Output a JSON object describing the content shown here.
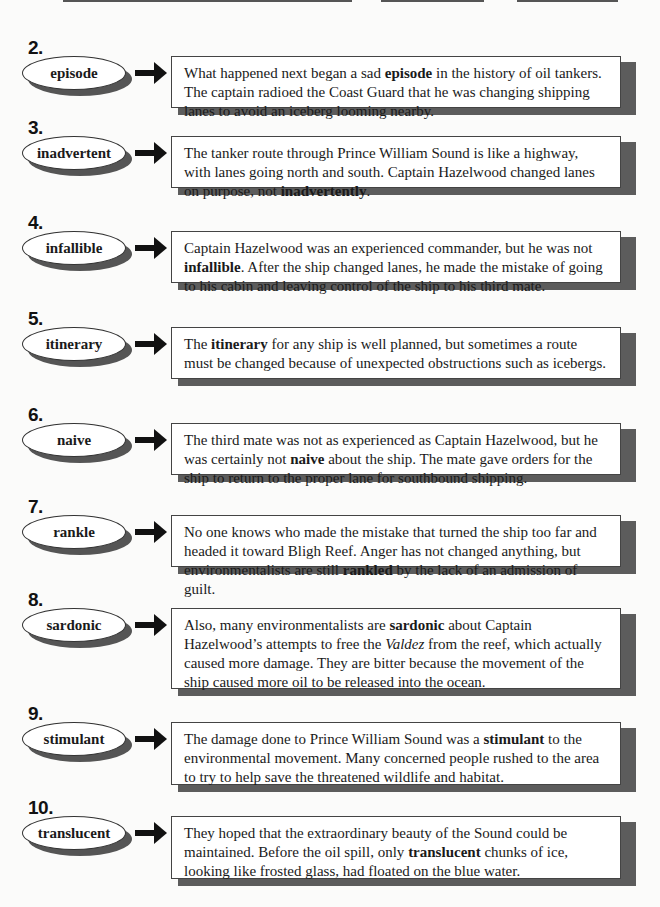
{
  "header_blanks": [
    {
      "name": "name-blank",
      "left": 63,
      "width": 289
    },
    {
      "name": "date-blank",
      "left": 381,
      "width": 103
    },
    {
      "name": "class-blank",
      "left": 517,
      "width": 101
    }
  ],
  "items": [
    {
      "number": "2.",
      "word": "episode",
      "top": 37,
      "box_height": 52,
      "text_before": "What happened next began a sad ",
      "bold": "episode",
      "text_after": " in the history of oil tankers. The captain radioed the Coast Guard that he was changing shipping lanes to avoid an iceberg looming nearby."
    },
    {
      "number": "3.",
      "word": "inadvertent",
      "top": 117,
      "box_height": 52,
      "text_before": "The tanker route through Prince William Sound is like a highway, with lanes going north and south. Captain Hazelwood changed lanes on purpose, not ",
      "bold": "inadvertently",
      "text_after": "."
    },
    {
      "number": "4.",
      "word": "infallible",
      "top": 212,
      "box_height": 52,
      "text_before": "Captain Hazelwood was an experienced commander, but he was not ",
      "bold": "infallible",
      "text_after": ". After the ship changed lanes, he made the mistake of going to his cabin and leaving control of the ship to his third mate."
    },
    {
      "number": "5.",
      "word": "itinerary",
      "top": 308,
      "box_height": 52,
      "text_before": "The ",
      "bold": "itinerary",
      "text_after": " for any ship is well planned, but sometimes a route must be changed because of unexpected obstructions such as icebergs."
    },
    {
      "number": "6.",
      "word": "naive",
      "top": 404,
      "box_height": 52,
      "text_before": "The third mate was not as experienced as Captain Hazelwood, but he was certainly not ",
      "bold": "naive",
      "text_after": " about the ship. The mate gave orders for the ship to return to the proper lane for southbound shipping."
    },
    {
      "number": "7.",
      "word": "rankle",
      "top": 496,
      "box_height": 52,
      "text_before": "No one knows who made the mistake that turned the ship too far and headed it toward Bligh Reef. Anger has not changed anything, but environmentalists are still ",
      "bold": "rankled",
      "text_after": " by the lack of an admission of guilt."
    },
    {
      "number": "8.",
      "word": "sardonic",
      "top": 589,
      "box_height": 81,
      "text_before": "Also, many environmentalists are ",
      "bold": "sardonic",
      "text_after": " about Captain Hazelwood’s attempts to free the ",
      "italic": "Valdez",
      "text_end": " from the reef, which actually caused more damage. They are bitter because the movement of the ship caused more oil to be released into the ocean."
    },
    {
      "number": "9.",
      "word": "stimulant",
      "top": 703,
      "box_height": 63,
      "text_before": "The damage done to Prince William Sound was a ",
      "bold": "stimulant",
      "text_after": " to the environmental movement. Many concerned people rushed to the area to try to help save the threatened wildlife and habitat."
    },
    {
      "number": "10.",
      "word": "translucent",
      "top": 797,
      "box_height": 63,
      "text_before": "They hoped that the extraordinary beauty of the Sound could be maintained. Before the oil spill, only ",
      "bold": "translucent",
      "text_after": " chunks of ice, looking like frosted glass, had floated on the blue water."
    }
  ]
}
